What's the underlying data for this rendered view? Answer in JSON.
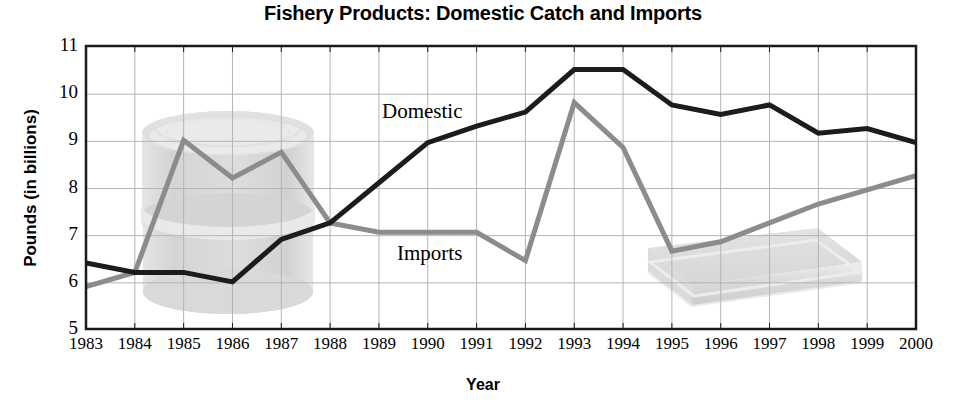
{
  "chart_data": {
    "type": "line",
    "title": "Fishery Products: Domestic Catch and Imports",
    "xlabel": "Year",
    "ylabel": "Pounds (in billions)",
    "x": [
      1983,
      1984,
      1985,
      1986,
      1987,
      1988,
      1989,
      1990,
      1991,
      1992,
      1993,
      1994,
      1995,
      1996,
      1997,
      1998,
      1999,
      2000
    ],
    "xtick_labels": [
      "1983",
      "1984",
      "1985",
      "1986",
      "1987",
      "1988",
      "1989",
      "1990",
      "1991",
      "1992",
      "1993",
      "1994",
      "1995",
      "1996",
      "1997",
      "1998",
      "1999",
      "2000"
    ],
    "ytick_labels": [
      "5",
      "6",
      "7",
      "8",
      "9",
      "10",
      "11"
    ],
    "ytick_values": [
      5,
      6,
      7,
      8,
      9,
      10,
      11
    ],
    "ylim": [
      5,
      11
    ],
    "xlim": [
      1983,
      2000
    ],
    "grid": true,
    "legend_position": "inline-annotations",
    "series": [
      {
        "name": "Domestic",
        "color": "#1c1c1c",
        "values": [
          6.4,
          6.2,
          6.2,
          6.0,
          6.9,
          7.25,
          8.1,
          8.95,
          9.3,
          9.6,
          10.5,
          10.5,
          9.75,
          9.55,
          9.75,
          9.15,
          9.25,
          8.95
        ]
      },
      {
        "name": "Imports",
        "color": "#8c8c8c",
        "values": [
          5.9,
          6.2,
          9.0,
          8.2,
          8.75,
          7.25,
          7.05,
          7.05,
          7.05,
          6.45,
          9.8,
          8.85,
          6.65,
          6.85,
          7.25,
          7.65,
          7.95,
          8.25
        ]
      }
    ],
    "annotations": [
      {
        "text": "Domestic",
        "x_px": 382,
        "y_px": 99
      },
      {
        "text": "Imports",
        "x_px": 397,
        "y_px": 241
      }
    ],
    "watermarks": [
      {
        "name": "can-watermark",
        "shape": "cylinder",
        "color": "#d6d6d6"
      },
      {
        "name": "box-watermark",
        "shape": "box",
        "color": "#d6d6d6"
      }
    ]
  },
  "axes": {
    "frame_color": "#1a1a1a",
    "grid_color": "#b4b4b4",
    "background": "#ffffff"
  }
}
